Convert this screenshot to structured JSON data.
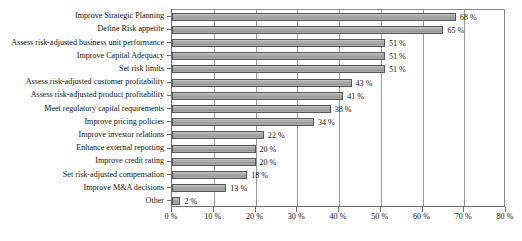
{
  "chart_data": {
    "type": "bar",
    "orientation": "horizontal",
    "title": "",
    "subtitle": "",
    "xlabel": "",
    "ylabel": "",
    "xlim": [
      0,
      80
    ],
    "xtick_labels": [
      "0 %",
      "10 %",
      "20 %",
      "30 %",
      "40 %",
      "50 %",
      "60 %",
      "70 %",
      "80 %"
    ],
    "xtick_values": [
      0,
      10,
      20,
      30,
      40,
      50,
      60,
      70,
      80
    ],
    "grid": "vertical",
    "legend": "none",
    "value_label_suffix": " %",
    "categories": [
      "Improve Strategic Planning",
      "Define Risk appetite",
      "Assess risk-adjusted business unit performance",
      "Improve Capital Adequacy",
      "Set risk limits",
      "Assess risk-adjusted customer profitability",
      "Assess risk-adjusted product profitability",
      "Meet regulatory capital requirements",
      "Improve pricing policies",
      "Improve investor relations",
      "Enhance external reporting",
      "Improve credit rating",
      "Set risk-adjusted compensation",
      "Improve M&A decisions",
      "Other"
    ],
    "values": [
      68,
      65,
      51,
      51,
      51,
      43,
      41,
      38,
      34,
      22,
      20,
      20,
      18,
      13,
      2
    ],
    "value_labels": [
      "68 %",
      "65 %",
      "51 %",
      "51 %",
      "51 %",
      "43 %",
      "41 %",
      "38 %",
      "34 %",
      "22 %",
      "20 %",
      "20 %",
      "18 %",
      "13 %",
      "2 %"
    ],
    "colors": {
      "bar_fill": "#a8a8a8",
      "bar_border": "#565656",
      "gridline": "#9a9a9a",
      "axis": "#6e6e6e",
      "text": "#111111",
      "background": "#ffffff"
    }
  }
}
